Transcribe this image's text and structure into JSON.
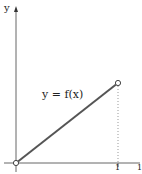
{
  "diagram": {
    "y_axis_label": "y",
    "function_label": "y = f(x)",
    "x_tick_labels": [
      "1",
      "1"
    ],
    "colors": {
      "axis": "#555555",
      "line": "#555555",
      "dotted": "#888888",
      "text": "#222222",
      "background": "#ffffff"
    },
    "points": {
      "start": {
        "x": 0,
        "y": 0,
        "marker": "open-circle"
      },
      "end": {
        "x": 1,
        "y": 1,
        "marker": "open-circle"
      }
    }
  }
}
